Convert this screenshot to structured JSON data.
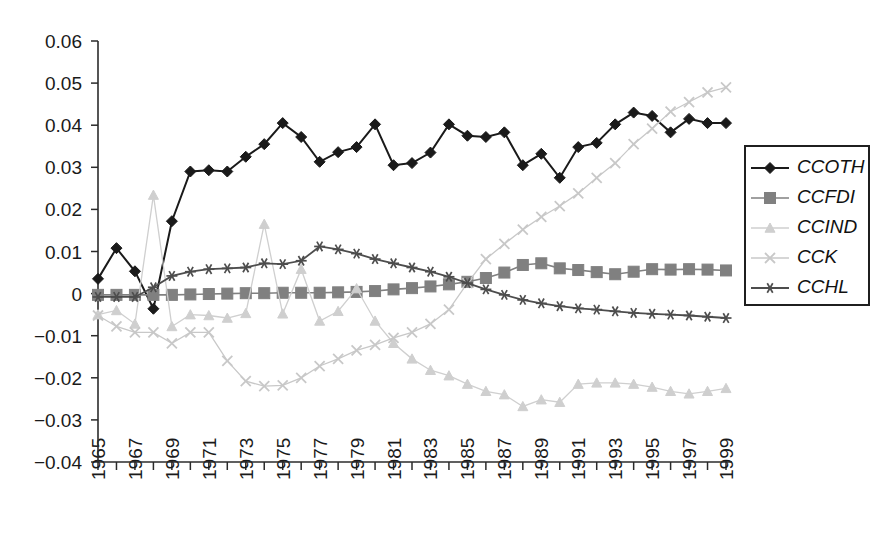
{
  "chart_data": {
    "type": "line",
    "title": "",
    "subtitle": "",
    "xlabel": "",
    "ylabel": "",
    "grid": false,
    "legend_position": "right",
    "xlim": [
      1965,
      1999
    ],
    "ylim": [
      -0.04,
      0.06
    ],
    "x": [
      1965,
      1966,
      1967,
      1968,
      1969,
      1970,
      1971,
      1972,
      1973,
      1974,
      1975,
      1976,
      1977,
      1978,
      1979,
      1980,
      1981,
      1982,
      1983,
      1984,
      1985,
      1986,
      1987,
      1988,
      1989,
      1990,
      1991,
      1992,
      1993,
      1994,
      1995,
      1996,
      1997,
      1998,
      1999
    ],
    "y_tick_labels": [
      "0.06",
      "0.05",
      "0.04",
      "0.03",
      "0.02",
      "0.01",
      "0",
      "-0.01",
      "-0.02",
      "-0.03",
      "-0.04"
    ],
    "y_tick_values": [
      0.06,
      0.05,
      0.04,
      0.03,
      0.02,
      0.01,
      0,
      -0.01,
      -0.02,
      -0.03,
      -0.04
    ],
    "x_tick_labels": [
      "1965",
      "1967",
      "1969",
      "1971",
      "1973",
      "1975",
      "1977",
      "1979",
      "1981",
      "1983",
      "1985",
      "1987",
      "1989",
      "1991",
      "1993",
      "1995",
      "1997",
      "1999"
    ],
    "x_tick_values": [
      1965,
      1967,
      1969,
      1971,
      1973,
      1975,
      1977,
      1979,
      1981,
      1983,
      1985,
      1987,
      1989,
      1991,
      1993,
      1995,
      1997,
      1999
    ],
    "series": [
      {
        "name": "CCOTH",
        "marker": "diamond",
        "color": "#1a1a1a",
        "values": [
          0.0035,
          0.0108,
          0.0053,
          -0.0036,
          0.0172,
          0.029,
          0.0293,
          0.029,
          0.0325,
          0.0355,
          0.0405,
          0.0372,
          0.0313,
          0.0336,
          0.0348,
          0.0402,
          0.0305,
          0.031,
          0.0335,
          0.0402,
          0.0375,
          0.0372,
          0.0383,
          0.0305,
          0.0332,
          0.0275,
          0.0348,
          0.0358,
          0.0402,
          0.043,
          0.0422,
          0.0383,
          0.0415,
          0.0405,
          0.0405
        ]
      },
      {
        "name": "CCFDI",
        "marker": "square",
        "color": "#808080",
        "values": [
          -0.0003,
          -0.0003,
          -0.0003,
          -0.0003,
          -0.0003,
          -0.0002,
          -0.0001,
          0.0,
          0.0001,
          0.0001,
          0.0002,
          0.0002,
          0.0002,
          0.0003,
          0.0004,
          0.0006,
          0.001,
          0.0013,
          0.0017,
          0.0022,
          0.0028,
          0.0037,
          0.005,
          0.0068,
          0.0072,
          0.006,
          0.0056,
          0.0051,
          0.0046,
          0.0052,
          0.0058,
          0.0057,
          0.0058,
          0.0057,
          0.0055
        ]
      },
      {
        "name": "CCIND",
        "marker": "triangle",
        "color": "#cfcfcf",
        "values": [
          -0.005,
          -0.004,
          -0.0072,
          0.0234,
          -0.0078,
          -0.005,
          -0.0052,
          -0.0058,
          -0.0047,
          0.0165,
          -0.0048,
          0.0058,
          -0.0065,
          -0.0042,
          0.0012,
          -0.0065,
          -0.0118,
          -0.0155,
          -0.0182,
          -0.0195,
          -0.0215,
          -0.0232,
          -0.024,
          -0.0268,
          -0.0252,
          -0.0258,
          -0.0215,
          -0.0212,
          -0.0212,
          -0.0215,
          -0.0222,
          -0.0232,
          -0.0238,
          -0.0232,
          -0.0225
        ]
      },
      {
        "name": "CCK",
        "marker": "x",
        "color": "#c8c8c8",
        "values": [
          -0.0052,
          -0.0078,
          -0.0092,
          -0.0092,
          -0.0118,
          -0.0092,
          -0.0092,
          -0.016,
          -0.0208,
          -0.022,
          -0.0218,
          -0.02,
          -0.0172,
          -0.0155,
          -0.0135,
          -0.0122,
          -0.0105,
          -0.0092,
          -0.0072,
          -0.0038,
          0.0025,
          0.0082,
          0.0118,
          0.0152,
          0.0182,
          0.0208,
          0.0238,
          0.0275,
          0.031,
          0.0355,
          0.0392,
          0.0432,
          0.0455,
          0.0478,
          0.049
        ]
      },
      {
        "name": "CCHL",
        "marker": "asterisk",
        "color": "#4d4d4d",
        "values": [
          -0.0008,
          -0.0008,
          -0.0008,
          0.0015,
          0.0042,
          0.0052,
          0.0058,
          0.006,
          0.0062,
          0.0072,
          0.007,
          0.0078,
          0.0112,
          0.0105,
          0.0095,
          0.0082,
          0.0072,
          0.0062,
          0.0052,
          0.004,
          0.0025,
          0.001,
          -0.0003,
          -0.0015,
          -0.0023,
          -0.003,
          -0.0035,
          -0.0038,
          -0.0042,
          -0.0046,
          -0.0048,
          -0.005,
          -0.0052,
          -0.0055,
          -0.0058
        ]
      }
    ]
  },
  "legend": {
    "items": [
      {
        "label": "CCOTH"
      },
      {
        "label": "CCFDI"
      },
      {
        "label": "CCIND"
      },
      {
        "label": "CCK"
      },
      {
        "label": "CCHL"
      }
    ]
  }
}
